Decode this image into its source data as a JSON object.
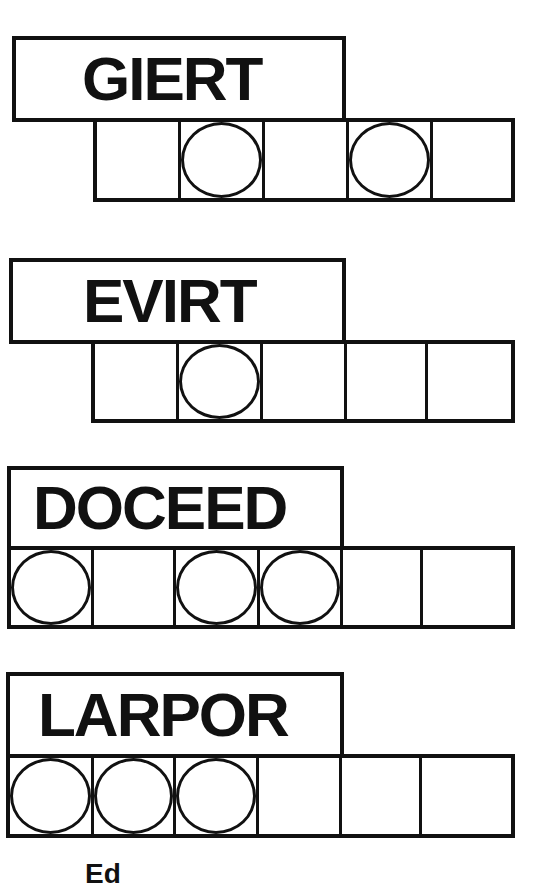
{
  "puzzles": [
    {
      "scrambled": "GIERT",
      "cells": 5,
      "circled": [
        false,
        true,
        false,
        true,
        false
      ]
    },
    {
      "scrambled": "EVIRT",
      "cells": 5,
      "circled": [
        false,
        true,
        false,
        false,
        false
      ]
    },
    {
      "scrambled": "DOCEED",
      "cells": 6,
      "circled": [
        true,
        false,
        true,
        true,
        false,
        false
      ]
    },
    {
      "scrambled": "LARPOR",
      "cells": 6,
      "circled": [
        true,
        true,
        true,
        false,
        false,
        false
      ]
    }
  ],
  "footer": {
    "text": "Ed"
  },
  "colors": {
    "ink": "#111111",
    "paper": "#ffffff"
  }
}
